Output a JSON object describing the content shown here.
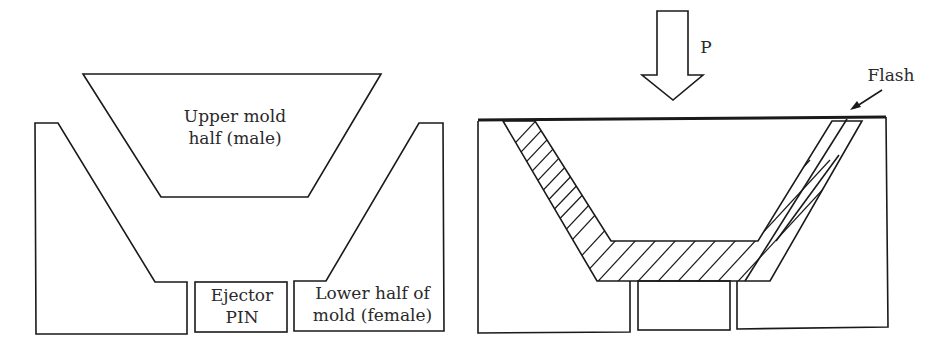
{
  "left_figure": {
    "upper_mold_label_line1": "Upper mold",
    "upper_mold_label_line2": "half (male)",
    "ejector_label_line1": "Ejector",
    "ejector_label_line2": "PIN",
    "lower_mold_label_line1": "Lower half of",
    "lower_mold_label_line2": "mold (female)"
  },
  "right_figure": {
    "pressure_label": "P",
    "flash_label": "Flash"
  },
  "colors": {
    "stroke": "#1a1a1a",
    "background": "#ffffff"
  }
}
